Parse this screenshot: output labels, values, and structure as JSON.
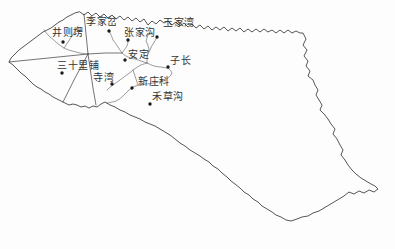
{
  "figure": {
    "kind": "watershed-basin-map",
    "background": "#fdfdfd",
    "boundary_color": "#2b2b2b",
    "divide_color": "#3a3a3a",
    "river_color": "#5a5a5a",
    "dot_color": "#1a1a1a",
    "label_color": "#333333",
    "width": 395,
    "height": 249
  },
  "stations": [
    {
      "name": "李家岔",
      "dot_x": 109,
      "dot_y": 31,
      "label_x": 86,
      "label_y": 25
    },
    {
      "name": "张家沟",
      "dot_x": 128,
      "dot_y": 40,
      "label_x": 124,
      "label_y": 36
    },
    {
      "name": "玉家湾",
      "dot_x": 157,
      "dot_y": 37,
      "label_x": 163,
      "label_y": 26
    },
    {
      "name": "井则塄",
      "dot_x": 63,
      "dot_y": 42,
      "label_x": 52,
      "label_y": 36
    },
    {
      "name": "三十里铺",
      "dot_x": 62,
      "dot_y": 73,
      "label_x": 57,
      "label_y": 69
    },
    {
      "name": "安定",
      "dot_x": 125,
      "dot_y": 60,
      "label_x": 128,
      "label_y": 58
    },
    {
      "name": "子长",
      "dot_x": 168,
      "dot_y": 67,
      "label_x": 170,
      "label_y": 64
    },
    {
      "name": "寺湾",
      "dot_x": 112,
      "dot_y": 84,
      "label_x": 93,
      "label_y": 81
    },
    {
      "name": "新庄科",
      "dot_x": 132,
      "dot_y": 88,
      "label_x": 138,
      "label_y": 85
    },
    {
      "name": "禾草沟",
      "dot_x": 150,
      "dot_y": 104,
      "label_x": 152,
      "label_y": 100
    }
  ]
}
